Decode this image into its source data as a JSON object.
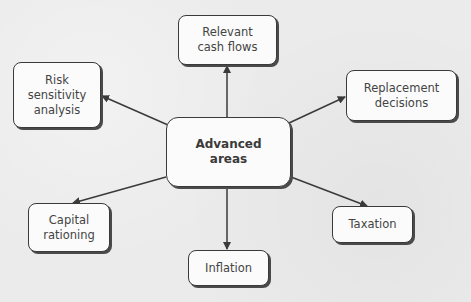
{
  "diagram": {
    "type": "hub-and-spoke",
    "center": {
      "id": "advanced",
      "lines": [
        "Advanced",
        "areas"
      ]
    },
    "nodes": [
      {
        "id": "cashflows",
        "lines": [
          "Relevant",
          "cash flows"
        ]
      },
      {
        "id": "risk",
        "lines": [
          "Risk",
          "sensitivity",
          "analysis"
        ]
      },
      {
        "id": "replacement",
        "lines": [
          "Replacement",
          "decisions"
        ]
      },
      {
        "id": "capital",
        "lines": [
          "Capital",
          "rationing"
        ]
      },
      {
        "id": "inflation",
        "lines": [
          "Inflation"
        ]
      },
      {
        "id": "taxation",
        "lines": [
          "Taxation"
        ]
      }
    ],
    "edges": [
      {
        "from": "advanced",
        "to": "cashflows",
        "arrow": "to"
      },
      {
        "from": "advanced",
        "to": "risk",
        "arrow": "to"
      },
      {
        "from": "advanced",
        "to": "replacement",
        "arrow": "to"
      },
      {
        "from": "advanced",
        "to": "capital",
        "arrow": "to"
      },
      {
        "from": "advanced",
        "to": "inflation",
        "arrow": "to"
      },
      {
        "from": "advanced",
        "to": "taxation",
        "arrow": "to"
      }
    ]
  },
  "colors": {
    "line": "#3a3a3a",
    "box_fill": "#fbfbfb",
    "background": "#ebebeb"
  }
}
